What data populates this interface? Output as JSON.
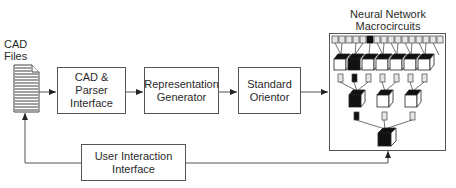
{
  "diagram": {
    "input": {
      "label_line1": "CAD",
      "label_line2": "Files",
      "icon": "document-icon"
    },
    "nodes": [
      {
        "id": "cad-parser",
        "line1": "CAD & Parser",
        "line2": "Interface"
      },
      {
        "id": "representation-generator",
        "line1": "Representation",
        "line2": "Generator"
      },
      {
        "id": "standard-orientor",
        "line1": "Standard",
        "line2": "Orientor"
      },
      {
        "id": "user-interaction",
        "line1": "User Interaction",
        "line2": "Interface"
      }
    ],
    "network": {
      "title_line1": "Neural Network",
      "title_line2": "Macrocircuits",
      "input_units": 16,
      "layer1_modules": 7,
      "layer2_modules": 3,
      "output_modules": 1
    },
    "edges": [
      {
        "from": "cad-files",
        "to": "cad-parser"
      },
      {
        "from": "cad-parser",
        "to": "representation-generator"
      },
      {
        "from": "representation-generator",
        "to": "standard-orientor"
      },
      {
        "from": "standard-orientor",
        "to": "neural-network-macrocircuits"
      },
      {
        "from": "user-interaction",
        "to": "cad-files"
      },
      {
        "from": "user-interaction",
        "to": "neural-network-macrocircuits"
      }
    ]
  }
}
